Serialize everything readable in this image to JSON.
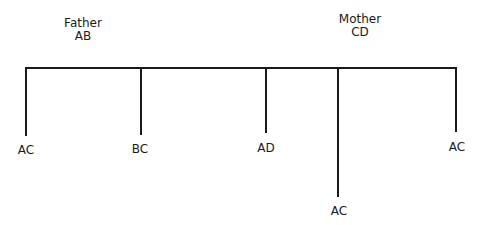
{
  "parents": {
    "father": {
      "label": "Father",
      "genotype": "AB"
    },
    "mother": {
      "label": "Mother",
      "genotype": "CD"
    }
  },
  "children": [
    {
      "genotype": "AC"
    },
    {
      "genotype": "BC"
    },
    {
      "genotype": "AD"
    },
    {
      "genotype": "AC"
    },
    {
      "genotype": "AC"
    }
  ],
  "colors": {
    "line": "#1a1a1a",
    "background": "#ffffff"
  }
}
